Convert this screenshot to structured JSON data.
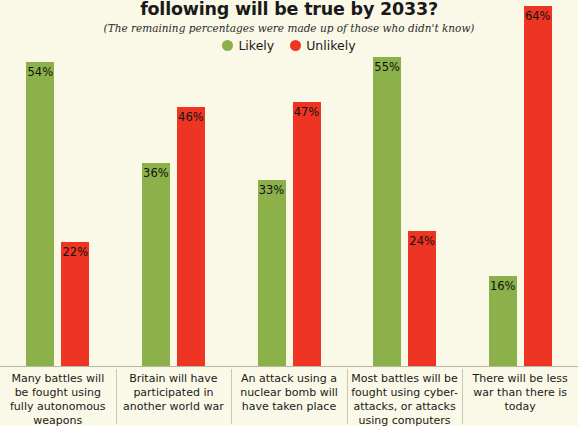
{
  "header": {
    "title": "following will be true by 2033?",
    "subtitle": "(The remaining percentages were made up of those who didn't know)"
  },
  "legend": {
    "items": [
      {
        "label": "Likely",
        "color": "#8cb04a",
        "icon": "circle-icon"
      },
      {
        "label": "Unlikely",
        "color": "#ee3524",
        "icon": "circle-icon"
      }
    ]
  },
  "chart_data": {
    "type": "bar",
    "title": "following will be true by 2033?",
    "subtitle": "(The remaining percentages were made up of those who didn't know)",
    "xlabel": "",
    "ylabel": "",
    "ylim": [
      0,
      64
    ],
    "grid": false,
    "legend_position": "top-center",
    "value_suffix": "%",
    "categories": [
      "Many battles will be fought using fully autonomous weapons",
      "Britain will have participated in another world war",
      "An attack using a nuclear bomb will have taken place",
      "Most battles will be fought using cyber-attacks, or attacks using computers",
      "There will be less war than there is today"
    ],
    "series": [
      {
        "name": "Likely",
        "color": "#8cb04a",
        "values": [
          54,
          36,
          33,
          55,
          16
        ],
        "labels": [
          "54%",
          "36%",
          "33%",
          "55%",
          "16%"
        ]
      },
      {
        "name": "Unlikely",
        "color": "#ee3524",
        "values": [
          22,
          46,
          47,
          24,
          64
        ],
        "labels": [
          "22%",
          "46%",
          "47%",
          "24%",
          "64%"
        ]
      }
    ]
  },
  "colors": {
    "background": "#faf8e6",
    "likely": "#8cb04a",
    "unlikely": "#ee3524",
    "axis": "#b9b6a2",
    "text": "#1a1a1a"
  }
}
